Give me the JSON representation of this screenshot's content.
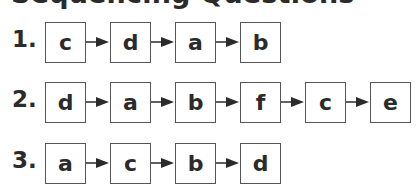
{
  "title": "Sequencing Questions",
  "questions": [
    {
      "number": "1.",
      "sequence": [
        "c",
        "d",
        "a",
        "b"
      ]
    },
    {
      "number": "2.",
      "sequence": [
        "d",
        "a",
        "b",
        "f",
        "c",
        "e"
      ]
    },
    {
      "number": "3.",
      "sequence": [
        "a",
        "c",
        "b",
        "d"
      ]
    }
  ],
  "colors": {
    "text": "#2b2b2b",
    "border": "#555555",
    "arrow": "#2b2b2b"
  }
}
